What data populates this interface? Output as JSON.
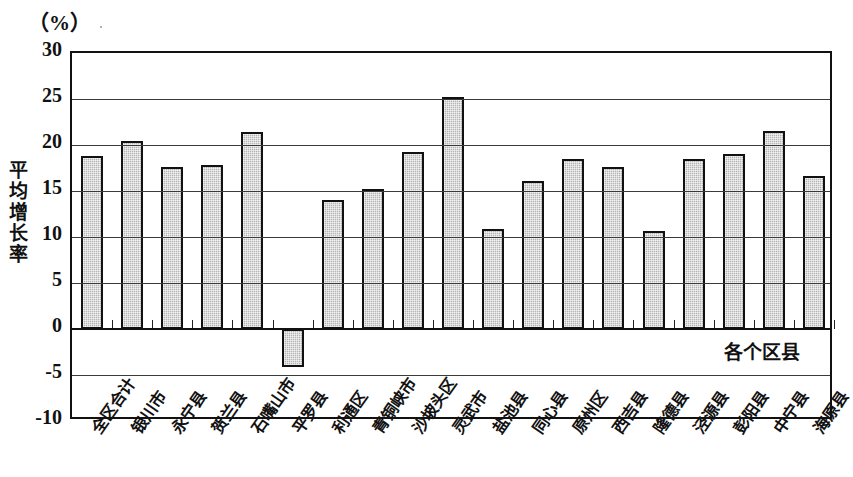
{
  "unit_caption": "（%）",
  "y_axis_title": "平均增长率",
  "x_axis_caption": "各个区县",
  "chart_data": {
    "type": "bar",
    "title": "",
    "subtitle": "",
    "xlabel": "各个区县",
    "ylabel": "平均增长率",
    "unit": "%",
    "ylim": [
      -10,
      30
    ],
    "yticks": [
      30,
      25,
      20,
      15,
      10,
      5,
      0,
      -5,
      -10
    ],
    "ytick_labels": [
      "30",
      "25",
      "20",
      "15",
      "10",
      "5",
      "0",
      "-5",
      "-10"
    ],
    "grid": true,
    "legend": "none",
    "bar_color": "#b4b4b4",
    "bar_border_color": "#111111",
    "categories": [
      "全区合计",
      "银川市",
      "永宁县",
      "贺兰县",
      "石嘴山市",
      "平罗县",
      "利通区",
      "青铜峡市",
      "沙坡头区",
      "灵武市",
      "盐池县",
      "同心县",
      "原州区",
      "西吉县",
      "隆德县",
      "泾源县",
      "彭阳县",
      "中宁县",
      "海原县"
    ],
    "values": [
      18.8,
      20.4,
      17.6,
      17.8,
      21.4,
      -4.1,
      14.0,
      15.2,
      19.2,
      25.2,
      10.9,
      16.1,
      18.5,
      17.6,
      10.6,
      18.5,
      19.0,
      21.5,
      16.6
    ]
  }
}
